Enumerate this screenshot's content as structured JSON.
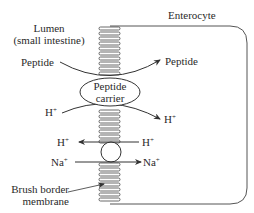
{
  "diagram": {
    "type": "membrane transport schematic",
    "labels": {
      "cell": "Enterocyte",
      "lumen_line1": "Lumen",
      "lumen_line2": "(small intestine)",
      "peptide_in": "Peptide",
      "peptide_out": "Peptide",
      "carrier_line1": "Peptide",
      "carrier_line2": "carrier",
      "h_in_top": "H",
      "h_out_top": "H",
      "h_left": "H",
      "h_right": "H",
      "na_left": "Na",
      "na_right": "Na",
      "plus": "+",
      "membrane_line1": "Brush border",
      "membrane_line2": "membrane"
    },
    "transporters": [
      {
        "name": "Peptide carrier",
        "shape": "ellipse",
        "cotransport": [
          "Peptide",
          "H+"
        ],
        "direction": "lumen-to-cell"
      },
      {
        "name": "Na+/H+ exchanger",
        "shape": "circle",
        "in": "Na+",
        "out": "H+"
      }
    ],
    "colors": {
      "line": "#3a3a3a",
      "background": "#ffffff"
    }
  }
}
